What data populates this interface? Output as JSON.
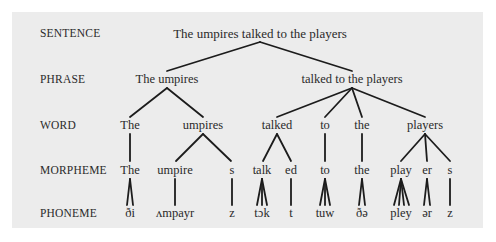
{
  "diagram": {
    "type": "linguistic-hierarchy-tree",
    "levels": [
      {
        "key": "sentence",
        "label": "SENTENCE",
        "y": 33
      },
      {
        "key": "phrase",
        "label": "PHRASE",
        "y": 79
      },
      {
        "key": "word",
        "label": "WORD",
        "y": 125
      },
      {
        "key": "morpheme",
        "label": "MORPHEME",
        "y": 170
      },
      {
        "key": "phoneme",
        "label": "PHONEME",
        "y": 213
      }
    ],
    "sentence": {
      "text": "The umpires talked to the players",
      "x": 260
    },
    "phrases": [
      {
        "text": "The umpires",
        "x": 167
      },
      {
        "text": "talked to the players",
        "x": 352
      }
    ],
    "words": [
      {
        "text": "The",
        "x": 130
      },
      {
        "text": "umpires",
        "x": 203
      },
      {
        "text": "talked",
        "x": 277
      },
      {
        "text": "to",
        "x": 325
      },
      {
        "text": "the",
        "x": 362
      },
      {
        "text": "players",
        "x": 425
      }
    ],
    "morphemes": [
      {
        "text": "The",
        "x": 130
      },
      {
        "text": "umpire",
        "x": 175
      },
      {
        "text": "s",
        "x": 232
      },
      {
        "text": "talk",
        "x": 262
      },
      {
        "text": "ed",
        "x": 291
      },
      {
        "text": "to",
        "x": 325
      },
      {
        "text": "the",
        "x": 362
      },
      {
        "text": "play",
        "x": 401
      },
      {
        "text": "er",
        "x": 427
      },
      {
        "text": "s",
        "x": 450
      }
    ],
    "phonemes": [
      {
        "text": "ði",
        "x": 130
      },
      {
        "text": "ʌmpayr",
        "x": 175
      },
      {
        "text": "z",
        "x": 232
      },
      {
        "text": "tɔk",
        "x": 262
      },
      {
        "text": "t",
        "x": 291
      },
      {
        "text": "tuw",
        "x": 325
      },
      {
        "text": "ðə",
        "x": 362
      },
      {
        "text": "pley",
        "x": 401
      },
      {
        "text": "ər",
        "x": 427
      },
      {
        "text": "z",
        "x": 450
      }
    ]
  }
}
